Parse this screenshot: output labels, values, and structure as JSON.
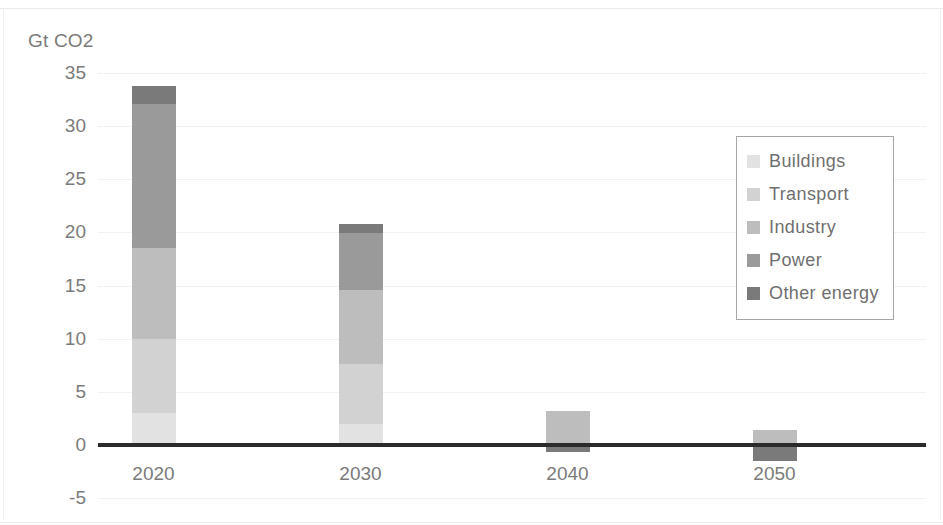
{
  "chart_data": {
    "type": "bar",
    "stacked": true,
    "title": "",
    "subtitle": "",
    "xlabel": "",
    "ylabel": "Gt CO2",
    "categories": [
      "2020",
      "2030",
      "2040",
      "2050"
    ],
    "ylim": [
      -5,
      35
    ],
    "yticks": [
      35,
      30,
      25,
      20,
      15,
      10,
      5,
      0,
      -5
    ],
    "ytick_labels": [
      "35",
      "30",
      "25",
      "20",
      "15",
      "10",
      "5",
      "0",
      "-5"
    ],
    "grid": true,
    "legend_position": "right-inside",
    "series": [
      {
        "name": "Buildings",
        "color": "#e2e2e2",
        "values": [
          3.0,
          2.0,
          0.0,
          0.0
        ]
      },
      {
        "name": "Transport",
        "color": "#d2d2d2",
        "values": [
          7.0,
          5.6,
          0.0,
          0.0
        ]
      },
      {
        "name": "Industry",
        "color": "#bdbdbd",
        "values": [
          8.5,
          7.0,
          3.2,
          1.4
        ]
      },
      {
        "name": "Power",
        "color": "#9a9a9a",
        "values": [
          13.6,
          5.35,
          0.0,
          0.0
        ]
      },
      {
        "name": "Other energy",
        "color": "#7a7a7a",
        "values": [
          1.7,
          0.85,
          -0.7,
          -1.5
        ]
      }
    ],
    "totals": [
      33.8,
      20.8,
      2.5,
      -0.1
    ],
    "annotations": []
  },
  "legend": {
    "items": [
      {
        "label": "Buildings",
        "color": "#e2e2e2"
      },
      {
        "label": "Transport",
        "color": "#d2d2d2"
      },
      {
        "label": "Industry",
        "color": "#bdbdbd"
      },
      {
        "label": "Power",
        "color": "#9a9a9a"
      },
      {
        "label": "Other energy",
        "color": "#7a7a7a"
      }
    ]
  },
  "axes": {
    "y_title": "Gt CO2",
    "y_labels": [
      "35",
      "30",
      "25",
      "20",
      "15",
      "10",
      "5",
      "0",
      "-5"
    ],
    "x_labels": [
      "2020",
      "2030",
      "2040",
      "2050"
    ]
  },
  "colors": {
    "axis_line": "#2b2b2b",
    "gridline": "#f2f2f2",
    "text": "#7b7b7b",
    "background": "#ffffff",
    "legend_border": "#a6a6a6"
  }
}
